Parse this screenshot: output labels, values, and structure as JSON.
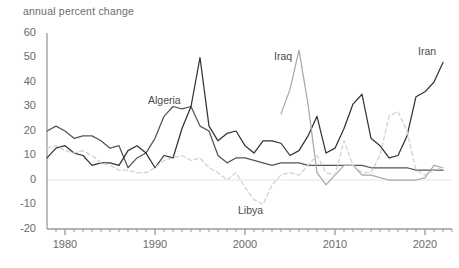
{
  "chart_data": {
    "type": "line",
    "title": "annual percent change",
    "xlabel": "",
    "ylabel": "annual percent change",
    "xlim": [
      1978,
      2023
    ],
    "ylim": [
      -20,
      60
    ],
    "yticks": [
      -20,
      -10,
      0,
      10,
      20,
      30,
      40,
      50,
      60
    ],
    "ytick_labels": [
      "-20",
      "-10",
      "0",
      "10",
      "20",
      "30",
      "40",
      "50",
      "60"
    ],
    "xticks": [
      1980,
      1990,
      2000,
      2010,
      2020
    ],
    "xtick_labels": [
      "1980",
      "1990",
      "2000",
      "2010",
      "2020"
    ],
    "minor_xticks": true,
    "grid": false,
    "legend": "inline-labels",
    "series": [
      {
        "name": "Algeria",
        "color": "#555555",
        "style": "solid",
        "label_x": 1991,
        "label_y": 32,
        "x": [
          1978,
          1979,
          1980,
          1981,
          1982,
          1983,
          1984,
          1985,
          1986,
          1987,
          1988,
          1989,
          1990,
          1991,
          1992,
          1993,
          1994,
          1995,
          1996,
          1997,
          1998,
          1999,
          2000,
          2001,
          2002,
          2003,
          2004,
          2005,
          2006,
          2007,
          2008,
          2009,
          2010,
          2011,
          2012,
          2013,
          2014,
          2015,
          2016,
          2017,
          2018,
          2019,
          2020,
          2021,
          2022
        ],
        "y": [
          20,
          22,
          20,
          17,
          18,
          18,
          16,
          13,
          14,
          5,
          9,
          11,
          17,
          26,
          30,
          29,
          30,
          22,
          20,
          10,
          7,
          9,
          9,
          8,
          7,
          6,
          7,
          7,
          7,
          6,
          6,
          6,
          6,
          6,
          6,
          6,
          5,
          5,
          5,
          5,
          5,
          4,
          4,
          4,
          4
        ]
      },
      {
        "name": "Iran",
        "color": "#333333",
        "style": "solid",
        "label_x": 2021,
        "label_y": 52,
        "x": [
          1978,
          1979,
          1980,
          1981,
          1982,
          1983,
          1984,
          1985,
          1986,
          1987,
          1988,
          1989,
          1990,
          1991,
          1992,
          1993,
          1994,
          1995,
          1996,
          1997,
          1998,
          1999,
          2000,
          2001,
          2002,
          2003,
          2004,
          2005,
          2006,
          2007,
          2008,
          2009,
          2010,
          2011,
          2012,
          2013,
          2014,
          2015,
          2016,
          2017,
          2018,
          2019,
          2020,
          2021,
          2022
        ],
        "y": [
          9,
          13,
          14,
          11,
          10,
          6,
          7,
          7,
          6,
          12,
          14,
          11,
          5,
          10,
          9,
          21,
          30,
          50,
          22,
          16,
          19,
          20,
          14,
          11,
          16,
          16,
          15,
          10,
          12,
          18,
          26,
          11,
          13,
          21,
          31,
          35,
          17,
          14,
          9,
          10,
          18,
          34,
          36,
          40,
          48
        ]
      },
      {
        "name": "Iraq",
        "color": "#a8a8a8",
        "style": "solid",
        "label_x": 2005,
        "label_y": 50,
        "x": [
          2004,
          2005,
          2006,
          2007,
          2008,
          2009,
          2010,
          2011,
          2012,
          2013,
          2014,
          2015,
          2016,
          2017,
          2018,
          2019,
          2020,
          2021,
          2022
        ],
        "y": [
          27,
          37,
          53,
          31,
          3,
          -2,
          2,
          6,
          6,
          2,
          2,
          1,
          0,
          0,
          0,
          0,
          1,
          6,
          5
        ]
      },
      {
        "name": "Libya",
        "color": "#d2d2d2",
        "style": "dashed",
        "label_x": 2001,
        "label_y": -13,
        "x": [
          1978,
          1979,
          1980,
          1981,
          1982,
          1983,
          1984,
          1985,
          1986,
          1987,
          1988,
          1989,
          1990,
          1991,
          1992,
          1993,
          1994,
          1995,
          1996,
          1997,
          1998,
          1999,
          2000,
          2001,
          2002,
          2003,
          2004,
          2005,
          2006,
          2007,
          2008,
          2009,
          2010,
          2011,
          2012,
          2013,
          2014,
          2015,
          2016,
          2017,
          2018,
          2019,
          2020,
          2021,
          2022
        ],
        "y": [
          13,
          14,
          12,
          11,
          12,
          10,
          7,
          6,
          4,
          4,
          3,
          3,
          5,
          8,
          9,
          10,
          8,
          9,
          5,
          3,
          0,
          3,
          -3,
          -8,
          -10,
          -2,
          2,
          3,
          2,
          6,
          10,
          3,
          2,
          16,
          6,
          3,
          3,
          10,
          26,
          28,
          20,
          4,
          2,
          4,
          5
        ]
      }
    ]
  },
  "axis": {
    "title": "annual percent change"
  }
}
